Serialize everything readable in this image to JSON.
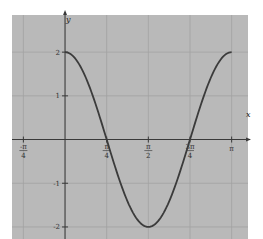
{
  "chart_data": {
    "type": "line",
    "title": "",
    "function": "y = 2cos(2x)",
    "xlabel": "x",
    "ylabel": "y",
    "xlim": [
      -1.0,
      3.45
    ],
    "ylim": [
      -2.55,
      2.85
    ],
    "grid": true,
    "legend": null,
    "x_ticks": [
      {
        "value": -0.7854,
        "label": "-π/4"
      },
      {
        "value": 0.7854,
        "label": "π/4"
      },
      {
        "value": 1.5708,
        "label": "π/2"
      },
      {
        "value": 2.3562,
        "label": "3π/4"
      },
      {
        "value": 3.1416,
        "label": "π"
      }
    ],
    "y_ticks": [
      {
        "value": 2,
        "label": "2"
      },
      {
        "value": 1,
        "label": "1"
      },
      {
        "value": -1,
        "label": "-1"
      },
      {
        "value": -2,
        "label": "-2"
      }
    ],
    "series": [
      {
        "name": "2cos(2x)",
        "x": [
          0,
          0.3927,
          0.7854,
          1.1781,
          1.5708,
          1.9635,
          2.3562,
          2.7489,
          3.1416
        ],
        "values": [
          2,
          1.414,
          0,
          -1.414,
          -2,
          -1.414,
          0,
          1.414,
          2
        ],
        "domain": [
          0,
          3.1416
        ]
      }
    ]
  },
  "colors": {
    "plot_background": "#b9b9b9",
    "grid": "#a2a2a2",
    "axis": "#3a3a3a",
    "curve": "#3b3b3b",
    "page_background": "#ffffff"
  }
}
